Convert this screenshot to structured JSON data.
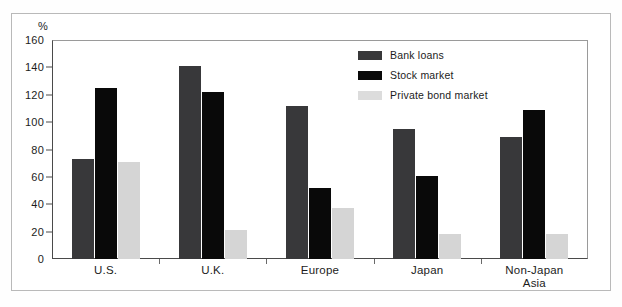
{
  "chart_data": {
    "type": "bar",
    "title": "",
    "xlabel": "",
    "ylabel": "%",
    "ylim": [
      0,
      160
    ],
    "yticks": [
      0,
      20,
      40,
      60,
      80,
      100,
      120,
      140,
      160
    ],
    "grid": false,
    "legend_position": "top-right",
    "categories": [
      "U.S.",
      "U.K.",
      "Europe",
      "Japan",
      "Non-Japan Asia"
    ],
    "category_lines": [
      [
        "U.S."
      ],
      [
        "U.K."
      ],
      [
        "Europe"
      ],
      [
        "Japan"
      ],
      [
        "Non-Japan",
        "Asia"
      ]
    ],
    "series": [
      {
        "name": "Bank loans",
        "color": "#38383a",
        "values": [
          73,
          141,
          112,
          95,
          89
        ]
      },
      {
        "name": "Stock market",
        "color": "#090909",
        "values": [
          125,
          122,
          52,
          61,
          109
        ]
      },
      {
        "name": "Private bond market",
        "color": "#d5d5d5",
        "values": [
          71,
          21,
          37,
          18,
          18
        ]
      }
    ]
  },
  "axis": {
    "unit_label": "%",
    "tick_labels": [
      "160",
      "140",
      "120",
      "100",
      "80",
      "60",
      "40",
      "20",
      "0"
    ]
  },
  "legend": {
    "items": [
      {
        "label": "Bank loans"
      },
      {
        "label": "Stock market"
      },
      {
        "label": "Private bond market"
      }
    ]
  }
}
